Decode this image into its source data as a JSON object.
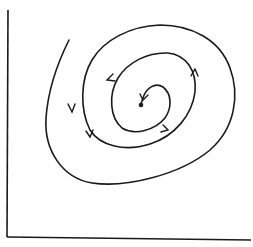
{
  "diagram": {
    "type": "phase-portrait",
    "stroke_color": "#1a1a1a",
    "background_color": "#ffffff",
    "axes": {
      "x_axis": {
        "label": ""
      },
      "y_axis": {
        "label": ""
      }
    },
    "equilibrium": {
      "x": 141,
      "y": 105
    },
    "arrows": [
      {
        "x": 72,
        "y": 110,
        "direction": "down"
      },
      {
        "x": 110,
        "y": 78,
        "direction": "down-left"
      },
      {
        "x": 90,
        "y": 135,
        "direction": "down"
      },
      {
        "x": 167,
        "y": 130,
        "direction": "up-right"
      },
      {
        "x": 195,
        "y": 71,
        "direction": "up"
      },
      {
        "x": 143,
        "y": 97,
        "direction": "down"
      }
    ]
  }
}
